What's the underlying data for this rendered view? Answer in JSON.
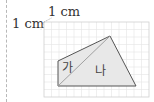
{
  "scale_labels": {
    "top": "1 cm",
    "left": "1 cm"
  },
  "grid": {
    "x": 44,
    "y": 22,
    "cell": 7.5,
    "cols": 14,
    "rows": 10,
    "line_color": "#e4e4e4",
    "border_color": "#d0d0d0"
  },
  "shape": {
    "vertices": {
      "A_top_left": [
        58,
        61
      ],
      "B_top": [
        110,
        36
      ],
      "C_bottom_right": [
        136,
        86
      ],
      "D_bottom_left": [
        58,
        86
      ]
    },
    "fill_color": "#e8e8e8",
    "stroke_color": "#555555",
    "diagonal_color": "#999999"
  },
  "regions": {
    "ga": "가",
    "na": "나"
  }
}
